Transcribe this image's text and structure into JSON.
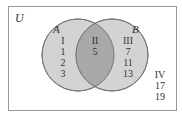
{
  "diagram": {
    "type": "venn",
    "universe_label": "U",
    "sets": [
      {
        "label": "A",
        "fill": "#d3d3d3"
      },
      {
        "label": "B",
        "fill": "#d3d3d3"
      }
    ],
    "intersection_fill": "#a9a9a9",
    "stroke": "#777777",
    "regions": [
      {
        "name": "I",
        "lines": [
          "I",
          "1",
          "2",
          "3"
        ]
      },
      {
        "name": "II",
        "lines": [
          "II",
          "5"
        ]
      },
      {
        "name": "III",
        "lines": [
          "III",
          "7",
          "11",
          "13"
        ]
      },
      {
        "name": "IV",
        "lines": [
          "IV",
          "17",
          "19"
        ]
      }
    ]
  }
}
